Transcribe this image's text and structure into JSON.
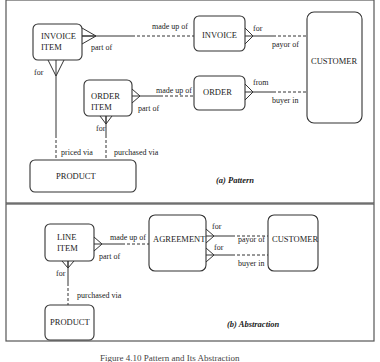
{
  "panels": [
    {
      "caption": "(a) Pattern",
      "entities": {
        "invoice_item": [
          "INVOICE",
          "ITEM"
        ],
        "invoice": "INVOICE",
        "customer": "CUSTOMER",
        "order_item": [
          "ORDER",
          "ITEM"
        ],
        "order": "ORDER",
        "product": "PRODUCT"
      },
      "relationships": {
        "invoice_item_invoice": {
          "near_item": "part of",
          "near_invoice": "made up of"
        },
        "invoice_customer": {
          "near_invoice": "for",
          "near_customer": "payor of"
        },
        "order_item_order": {
          "near_item": "part of",
          "near_order": "made up of"
        },
        "order_customer": {
          "near_order": "from",
          "near_customer": "buyer in"
        },
        "invoice_item_product": {
          "near_item": "for",
          "near_product": "priced via"
        },
        "order_item_product": {
          "near_item": "for",
          "near_product": "purchased via"
        }
      }
    },
    {
      "caption": "(b) Abstraction",
      "entities": {
        "line_item": [
          "LINE",
          "ITEM"
        ],
        "agreement": "AGREEMENT",
        "customer": "CUSTOMER",
        "product": "PRODUCT"
      },
      "relationships": {
        "line_item_agreement": {
          "near_item": "part of",
          "near_agreement": "made up of"
        },
        "agreement_customer_payor": {
          "near_agreement": "for",
          "near_customer": "payor of"
        },
        "agreement_customer_buyer": {
          "near_agreement": "for",
          "near_customer": "buyer in"
        },
        "line_item_product": {
          "near_item": "for",
          "near_product": "purchased via"
        }
      }
    }
  ],
  "figure_caption": "Figure 4.10 Pattern and Its Abstraction"
}
